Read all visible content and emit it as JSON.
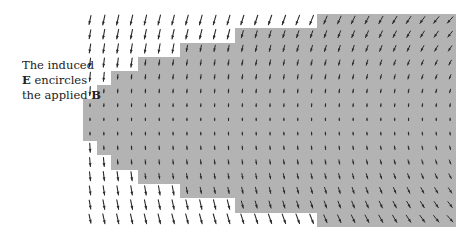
{
  "figure": {
    "caption_lines": [
      {
        "text_before": "The induced",
        "bold": "",
        "text_after": ""
      },
      {
        "text_before": "",
        "bold": "E",
        "text_after": " encircles"
      },
      {
        "text_before": "the applied ",
        "bold": "B",
        "text_after": ""
      }
    ],
    "colors": {
      "background": "#ffffff",
      "field_region": "#b3b3b3",
      "arrow": "#2a2a2a",
      "text": "#222222"
    },
    "grid": {
      "x0": 90,
      "dx": 13.85,
      "cols": 27,
      "y0": 20,
      "dy": 14.2,
      "rows": 15
    },
    "field_center": {
      "x": 560,
      "y": 120
    },
    "field_region_steps": [
      {
        "y_top": 14,
        "y_bottom": 28,
        "x_left": 317,
        "x_right": 456
      },
      {
        "y_top": 28,
        "y_bottom": 43,
        "x_left": 235,
        "x_right": 456
      },
      {
        "y_top": 43,
        "y_bottom": 57,
        "x_left": 180,
        "x_right": 456
      },
      {
        "y_top": 57,
        "y_bottom": 71,
        "x_left": 138,
        "x_right": 456
      },
      {
        "y_top": 71,
        "y_bottom": 85,
        "x_left": 111,
        "x_right": 456
      },
      {
        "y_top": 85,
        "y_bottom": 99,
        "x_left": 97,
        "x_right": 456
      },
      {
        "y_top": 99,
        "y_bottom": 141,
        "x_left": 83,
        "x_right": 456
      },
      {
        "y_top": 141,
        "y_bottom": 155,
        "x_left": 97,
        "x_right": 456
      },
      {
        "y_top": 155,
        "y_bottom": 170,
        "x_left": 111,
        "x_right": 456
      },
      {
        "y_top": 170,
        "y_bottom": 184,
        "x_left": 138,
        "x_right": 456
      },
      {
        "y_top": 184,
        "y_bottom": 198,
        "x_left": 180,
        "x_right": 456
      },
      {
        "y_top": 198,
        "y_bottom": 213,
        "x_left": 235,
        "x_right": 456
      },
      {
        "y_top": 213,
        "y_bottom": 227,
        "x_left": 317,
        "x_right": 456
      }
    ],
    "legend_icons": [
      "arrow-icon"
    ]
  }
}
